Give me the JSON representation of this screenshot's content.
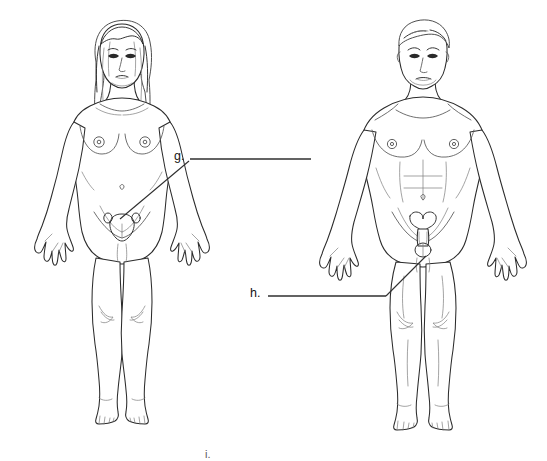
{
  "worksheet": {
    "title": "Anatomy labeling worksheet — external reproductive structures",
    "background_color": "#ffffff",
    "line_color": "#2f2f2f",
    "outline_color": "#2b2b2b",
    "detail_color": "#555555"
  },
  "figures": [
    {
      "id": "female-figure",
      "name": "female-anatomical-figure",
      "description": "Front view line drawing of an adult female body, standing, arms slightly away from sides, long hair",
      "position": "left"
    },
    {
      "id": "male-figure",
      "name": "male-anatomical-figure",
      "description": "Front view line drawing of an adult male body, standing, arms slightly away from sides, short hair",
      "position": "right"
    }
  ],
  "labels": [
    {
      "id": "g",
      "text": "g.",
      "answer_value": "",
      "points_to": "female external genitalia",
      "has_answer_line": true,
      "has_leader_line": true
    },
    {
      "id": "h",
      "text": "h.",
      "answer_value": "",
      "points_to": "male external genitalia",
      "has_answer_line": true,
      "has_leader_line": true
    },
    {
      "id": "i",
      "text": "i.",
      "answer_value": "",
      "points_to": "",
      "has_answer_line": false,
      "has_leader_line": false
    }
  ]
}
